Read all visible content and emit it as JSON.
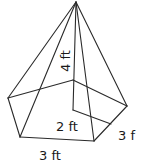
{
  "diagram": {
    "type": "pentagonal-pyramid",
    "colors": {
      "stroke": "#2a2a2a",
      "text": "#1a1a1a",
      "background": "#ffffff"
    },
    "labels": {
      "height": "4 ft",
      "apothem": "2 ft",
      "side_right": "3 f",
      "side_bottom": "3 ft"
    }
  }
}
